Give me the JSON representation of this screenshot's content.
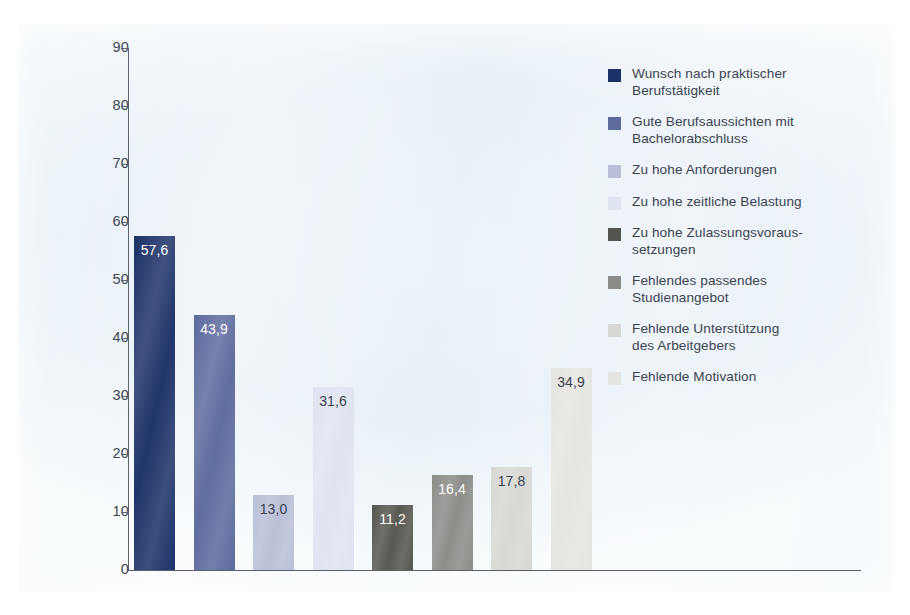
{
  "chart_data": {
    "type": "bar",
    "title": "",
    "subtitle": "",
    "xlabel": "",
    "ylabel": "",
    "ylim": [
      0,
      90
    ],
    "ytick_step": 10,
    "yticks": [
      "90",
      "80",
      "70",
      "60",
      "50",
      "40",
      "30",
      "20",
      "10",
      "0"
    ],
    "grid": false,
    "legend_position": "right",
    "categories": [
      "Wunsch nach praktischer Berufstätigkeit",
      "Gute Berufsaussichten mit Bachelorabschluss",
      "Zu hohe Anforderungen",
      "Zu hohe zeitliche Belastung",
      "Zu hohe Zulassungsvoraussetzungen",
      "Fehlendes passendes Studienangebot",
      "Fehlende Unterstützung des Arbeitgebers",
      "Fehlende Motivation"
    ],
    "values": [
      57.6,
      43.9,
      13.0,
      31.6,
      11.2,
      16.4,
      17.8,
      34.9
    ],
    "value_labels": [
      "57,6",
      "43,9",
      "13,0",
      "31,6",
      "11,2",
      "16,4",
      "17,8",
      "34,9"
    ],
    "colors": [
      "#1c3168",
      "#5c6a9d",
      "#b9bfd7",
      "#dee4f0",
      "#55554f",
      "#8b8b88",
      "#d7d7d3",
      "#e6e4e0"
    ]
  },
  "legend": {
    "items": [
      {
        "label": "Wunsch nach praktischer\nBerufstätigkeit",
        "color": "#1c3168"
      },
      {
        "label": "Gute Berufsaussichten mit\nBachelorabschluss",
        "color": "#5c6a9d"
      },
      {
        "label": "Zu hohe Anforderungen",
        "color": "#b9bfd7"
      },
      {
        "label": "Zu hohe zeitliche Belastung",
        "color": "#dee4f0"
      },
      {
        "label": "Zu hohe Zulassungsvoraus-\nsetzungen",
        "color": "#55554f"
      },
      {
        "label": "Fehlendes passendes\nStudienangebot",
        "color": "#8b8b88"
      },
      {
        "label": "Fehlende Unterstützung\ndes Arbeitgebers",
        "color": "#d7d7d3"
      },
      {
        "label": "Fehlende Motivation",
        "color": "#e6e4e0"
      }
    ]
  },
  "axis": {
    "value_label_colors": [
      "#ffffff",
      "#ffffff",
      "#3c4350",
      "#3c4350",
      "#ffffff",
      "#ffffff",
      "#3c4350",
      "#3c4350"
    ]
  }
}
